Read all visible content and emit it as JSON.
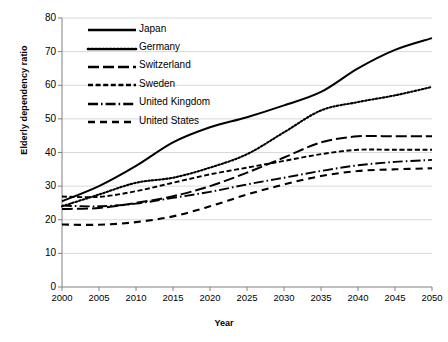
{
  "chart_data": {
    "type": "line",
    "title": "",
    "xlabel": "Year",
    "ylabel": "Elderly dependency ratio",
    "xlim": [
      2000,
      2050
    ],
    "ylim": [
      0,
      80
    ],
    "xticks": [
      2000,
      2005,
      2010,
      2015,
      2020,
      2025,
      2030,
      2035,
      2040,
      2045,
      2050
    ],
    "yticks": [
      0,
      10,
      20,
      30,
      40,
      50,
      60,
      70,
      80
    ],
    "grid": "horizontal",
    "legend_position": "upper-left-inside",
    "x": [
      2000,
      2005,
      2010,
      2015,
      2020,
      2025,
      2030,
      2035,
      2040,
      2045,
      2050
    ],
    "series": [
      {
        "name": "Japan",
        "style": "solid",
        "values": [
          25.5,
          30.0,
          36.0,
          43.0,
          47.5,
          50.5,
          54.0,
          58.0,
          65.0,
          70.5,
          74.0
        ]
      },
      {
        "name": "Germany",
        "style": "dotted",
        "values": [
          24.0,
          27.5,
          31.0,
          32.5,
          35.5,
          39.5,
          46.0,
          52.5,
          55.0,
          57.0,
          59.5
        ]
      },
      {
        "name": "Switzerland",
        "style": "long-dash",
        "values": [
          23.2,
          23.5,
          25.0,
          27.0,
          30.0,
          34.0,
          38.5,
          43.0,
          44.8,
          44.8,
          44.8
        ]
      },
      {
        "name": "Sweden",
        "style": "dashed",
        "values": [
          26.9,
          26.8,
          28.5,
          31.0,
          33.5,
          35.5,
          37.5,
          39.5,
          40.8,
          40.8,
          40.8
        ]
      },
      {
        "name": "United Kingdom",
        "style": "dash-dot",
        "values": [
          24.2,
          24.0,
          24.8,
          26.5,
          28.3,
          30.5,
          32.5,
          34.5,
          36.2,
          37.2,
          37.8
        ]
      },
      {
        "name": "United States",
        "style": "medium-dash",
        "values": [
          18.6,
          18.5,
          19.3,
          21.0,
          24.0,
          27.5,
          30.5,
          33.0,
          34.5,
          35.0,
          35.3
        ]
      }
    ]
  },
  "legend": {
    "items": [
      {
        "label": "Japan",
        "key": "solid-line-key"
      },
      {
        "label": "Germany",
        "key": "dotted-line-key"
      },
      {
        "label": "Switzerland",
        "key": "long-dash-dot-line-key"
      },
      {
        "label": "Sweden",
        "key": "dashed-line-key"
      },
      {
        "label": "United Kingdom",
        "key": "long-dash-dot-line-key"
      },
      {
        "label": "United States",
        "key": "medium-dash-line-key"
      }
    ]
  },
  "colors": {
    "line": "#000000",
    "grid": "#d9d9d9",
    "axis": "#808080",
    "background": "#ffffff"
  }
}
